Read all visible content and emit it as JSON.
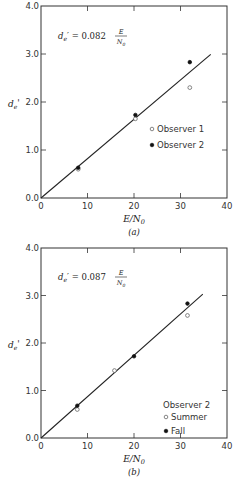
{
  "chart_data": [
    {
      "type": "scatter",
      "panel_label": "(a)",
      "xlabel": "E/N0",
      "ylabel": "de'",
      "xlim": [
        0,
        40
      ],
      "ylim": [
        0.0,
        4.0
      ],
      "xticks": [
        "0",
        "10",
        "20",
        "30",
        "40"
      ],
      "yticks": [
        "0.0",
        "1.0",
        "2.0",
        "3.0",
        "4.0"
      ],
      "grid": false,
      "equation": {
        "lhs": "de' = 0.082",
        "num": "E",
        "den": "N0",
        "slope": 0.082
      },
      "fit_line": {
        "x0": 0,
        "x1": 36.5,
        "slope": 0.082
      },
      "legend_position": "right-middle",
      "legend_title": "",
      "series": [
        {
          "name": "Observer 1",
          "marker": "open-circle",
          "x": [
            8,
            20.3,
            32
          ],
          "y": [
            0.6,
            1.65,
            2.3
          ]
        },
        {
          "name": "Observer 2",
          "marker": "filled-circle",
          "x": [
            8,
            20.3,
            32
          ],
          "y": [
            0.63,
            1.73,
            2.83
          ]
        }
      ]
    },
    {
      "type": "scatter",
      "panel_label": "(b)",
      "xlabel": "E/N0",
      "ylabel": "de'",
      "xlim": [
        0,
        40
      ],
      "ylim": [
        0.0,
        4.0
      ],
      "xticks": [
        "0",
        "10",
        "20",
        "30",
        "40"
      ],
      "yticks": [
        "0.0",
        "1.0",
        "2.0",
        "3.0",
        "4.0"
      ],
      "grid": false,
      "equation": {
        "lhs": "de' = 0.087",
        "num": "E",
        "den": "N0",
        "slope": 0.087
      },
      "fit_line": {
        "x0": 0,
        "x1": 34.8,
        "slope": 0.087
      },
      "legend_position": "bottom-right",
      "legend_title": "Observer 2",
      "series": [
        {
          "name": "Summer",
          "marker": "open-circle",
          "x": [
            7.8,
            15.8,
            31.5
          ],
          "y": [
            0.6,
            1.42,
            2.58
          ]
        },
        {
          "name": "Fall",
          "marker": "filled-circle",
          "x": [
            7.8,
            20,
            31.5
          ],
          "y": [
            0.68,
            1.72,
            2.83
          ]
        }
      ]
    }
  ]
}
